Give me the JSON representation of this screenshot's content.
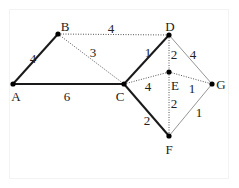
{
  "diagram": {
    "type": "weighted-graph",
    "nodes": [
      {
        "id": "A",
        "label": "A",
        "x": 13,
        "y": 84,
        "lx": 16,
        "ly": 101,
        "anchor": "middle"
      },
      {
        "id": "B",
        "label": "B",
        "x": 58,
        "y": 34,
        "lx": 65,
        "ly": 31,
        "anchor": "middle"
      },
      {
        "id": "C",
        "label": "C",
        "x": 124,
        "y": 84,
        "lx": 120,
        "ly": 101,
        "anchor": "middle"
      },
      {
        "id": "D",
        "label": "D",
        "x": 169,
        "y": 35,
        "lx": 170,
        "ly": 31,
        "anchor": "middle"
      },
      {
        "id": "E",
        "label": "E",
        "x": 169,
        "y": 72,
        "lx": 175,
        "ly": 90,
        "anchor": "middle"
      },
      {
        "id": "F",
        "label": "F",
        "x": 169,
        "y": 136,
        "lx": 169,
        "ly": 154,
        "anchor": "middle"
      },
      {
        "id": "G",
        "label": "G",
        "x": 212,
        "y": 84,
        "lx": 221,
        "ly": 89,
        "anchor": "middle"
      }
    ],
    "edges": [
      {
        "from": "A",
        "to": "B",
        "weight": "4",
        "style": "thick",
        "lx": 33,
        "ly": 63
      },
      {
        "from": "A",
        "to": "C",
        "weight": "6",
        "style": "thick",
        "lx": 67,
        "ly": 101
      },
      {
        "from": "C",
        "to": "D",
        "weight": "1",
        "style": "thick",
        "lx": 148,
        "ly": 57
      },
      {
        "from": "C",
        "to": "F",
        "weight": "2",
        "style": "thick",
        "lx": 147,
        "ly": 125
      },
      {
        "from": "B",
        "to": "D",
        "weight": "4",
        "style": "dotted",
        "lx": 111,
        "ly": 33
      },
      {
        "from": "B",
        "to": "C",
        "weight": "3",
        "style": "dotted",
        "lx": 93,
        "ly": 57
      },
      {
        "from": "C",
        "to": "E",
        "weight": "4",
        "style": "dotted",
        "lx": 148,
        "ly": 91
      },
      {
        "from": "D",
        "to": "E",
        "weight": "2",
        "style": "dotted",
        "lx": 174,
        "ly": 59
      },
      {
        "from": "E",
        "to": "G",
        "weight": "1",
        "style": "dotted",
        "lx": 192,
        "ly": 93
      },
      {
        "from": "E",
        "to": "F",
        "weight": "2",
        "style": "dotted",
        "lx": 174,
        "ly": 108
      },
      {
        "from": "D",
        "to": "G",
        "weight": "4",
        "style": "thin",
        "lx": 193,
        "ly": 59
      },
      {
        "from": "G",
        "to": "F",
        "weight": "1",
        "style": "thin",
        "lx": 199,
        "ly": 117
      }
    ],
    "colors": {
      "thick": "#1a1a1a",
      "dotted": "#555555",
      "thin": "#7a7a7a",
      "node": "#000000"
    }
  }
}
